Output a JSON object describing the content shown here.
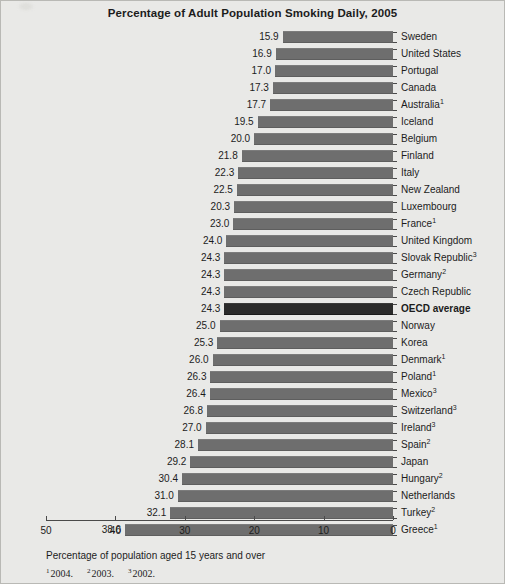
{
  "chart_data": {
    "type": "bar",
    "orientation": "horizontal-reversed",
    "title": "Percentage of Adult Population Smoking Daily, 2005",
    "xlabel": "",
    "ylabel": "",
    "xlim": [
      50,
      0
    ],
    "xticks": [
      50,
      40,
      30,
      20,
      10,
      0
    ],
    "grid": false,
    "legend": "none",
    "axis_note": "Percentage of population aged 15 years and over",
    "footnote_markers": [
      {
        "marker": "1",
        "text": "2004."
      },
      {
        "marker": "2",
        "text": "2003."
      },
      {
        "marker": "3",
        "text": "2002."
      }
    ],
    "highlight_category": "OECD average",
    "bar_color": "#6e6e6e",
    "highlight_bar_color": "#2b2b2b",
    "background_color": "#e9e9e7",
    "categories": [
      "Sweden",
      "United States",
      "Portugal",
      "Canada",
      "Australia",
      "Iceland",
      "Belgium",
      "Finland",
      "Italy",
      "New Zealand",
      "Luxembourg",
      "France",
      "United Kingdom",
      "Slovak Republic",
      "Germany",
      "Czech Republic",
      "OECD average",
      "Norway",
      "Korea",
      "Denmark",
      "Poland",
      "Mexico",
      "Switzerland",
      "Ireland",
      "Spain",
      "Japan",
      "Hungary",
      "Netherlands",
      "Turkey",
      "Greece"
    ],
    "values": [
      15.9,
      16.9,
      17.0,
      17.3,
      17.7,
      19.5,
      20.0,
      21.8,
      22.3,
      22.5,
      20.3,
      23.0,
      24.0,
      24.3,
      24.3,
      24.3,
      24.3,
      25.0,
      25.3,
      26.0,
      26.3,
      26.4,
      26.8,
      27.0,
      28.1,
      29.2,
      30.4,
      31.0,
      32.1,
      38.6
    ],
    "rows": [
      {
        "label": "Sweden",
        "footnote": "",
        "value": "15.9",
        "bar_value": 15.9
      },
      {
        "label": "United States",
        "footnote": "",
        "value": "16.9",
        "bar_value": 16.9
      },
      {
        "label": "Portugal",
        "footnote": "",
        "value": "17.0",
        "bar_value": 17.0
      },
      {
        "label": "Canada",
        "footnote": "",
        "value": "17.3",
        "bar_value": 17.3
      },
      {
        "label": "Australia",
        "footnote": "1",
        "value": "17.7",
        "bar_value": 17.7
      },
      {
        "label": "Iceland",
        "footnote": "",
        "value": "19.5",
        "bar_value": 19.5
      },
      {
        "label": "Belgium",
        "footnote": "",
        "value": "20.0",
        "bar_value": 20.0
      },
      {
        "label": "Finland",
        "footnote": "",
        "value": "21.8",
        "bar_value": 21.8
      },
      {
        "label": "Italy",
        "footnote": "",
        "value": "22.3",
        "bar_value": 22.3
      },
      {
        "label": "New Zealand",
        "footnote": "",
        "value": "22.5",
        "bar_value": 22.5
      },
      {
        "label": "Luxembourg",
        "footnote": "",
        "value": "20.3",
        "bar_value": 22.9
      },
      {
        "label": "France",
        "footnote": "1",
        "value": "23.0",
        "bar_value": 23.0
      },
      {
        "label": "United Kingdom",
        "footnote": "",
        "value": "24.0",
        "bar_value": 24.0
      },
      {
        "label": "Slovak Republic",
        "footnote": "3",
        "value": "24.3",
        "bar_value": 24.3
      },
      {
        "label": "Germany",
        "footnote": "2",
        "value": "24.3",
        "bar_value": 24.3
      },
      {
        "label": "Czech Republic",
        "footnote": "",
        "value": "24.3",
        "bar_value": 24.3
      },
      {
        "label": "OECD average",
        "footnote": "",
        "value": "24.3",
        "bar_value": 24.3
      },
      {
        "label": "Norway",
        "footnote": "",
        "value": "25.0",
        "bar_value": 25.0
      },
      {
        "label": "Korea",
        "footnote": "",
        "value": "25.3",
        "bar_value": 25.3
      },
      {
        "label": "Denmark",
        "footnote": "1",
        "value": "26.0",
        "bar_value": 26.0
      },
      {
        "label": "Poland",
        "footnote": "1",
        "value": "26.3",
        "bar_value": 26.3
      },
      {
        "label": "Mexico",
        "footnote": "3",
        "value": "26.4",
        "bar_value": 26.4
      },
      {
        "label": "Switzerland",
        "footnote": "3",
        "value": "26.8",
        "bar_value": 26.8
      },
      {
        "label": "Ireland",
        "footnote": "3",
        "value": "27.0",
        "bar_value": 27.0
      },
      {
        "label": "Spain",
        "footnote": "2",
        "value": "28.1",
        "bar_value": 28.1
      },
      {
        "label": "Japan",
        "footnote": "",
        "value": "29.2",
        "bar_value": 29.2
      },
      {
        "label": "Hungary",
        "footnote": "2",
        "value": "30.4",
        "bar_value": 30.4
      },
      {
        "label": "Netherlands",
        "footnote": "",
        "value": "31.0",
        "bar_value": 31.0
      },
      {
        "label": "Turkey",
        "footnote": "2",
        "value": "32.1",
        "bar_value": 32.1
      },
      {
        "label": "Greece",
        "footnote": "1",
        "value": "38.6",
        "bar_value": 38.6
      }
    ]
  }
}
